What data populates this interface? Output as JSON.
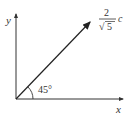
{
  "diagram": {
    "type": "vector-diagram",
    "axes": {
      "x_label": "x",
      "y_label": "y"
    },
    "vector": {
      "label_numerator": "2",
      "label_denominator_radical": "√",
      "label_denominator_value": "5",
      "label_suffix": "c",
      "angle_label": "45°",
      "angle_degrees": 45
    },
    "colors": {
      "stroke": "#333333",
      "background": "#ffffff"
    }
  }
}
